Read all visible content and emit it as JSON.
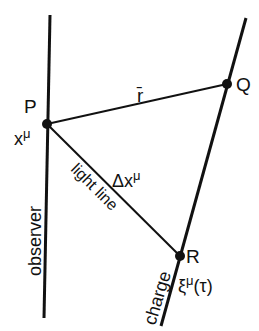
{
  "diagram": {
    "points": {
      "P": {
        "label": "P",
        "coord_label": "x",
        "coord_sup": "μ"
      },
      "Q": {
        "label": "Q"
      },
      "R": {
        "label": "R",
        "coord_label": "ξ",
        "coord_sup": "μ",
        "coord_arg": "(τ)"
      }
    },
    "segments": {
      "PQ": {
        "label": "r̄"
      },
      "PR": {
        "label_delta": "Δx",
        "label_sup": "μ",
        "side_label": "light line"
      }
    },
    "worldlines": {
      "observer": {
        "label": "observer"
      },
      "charge": {
        "label": "charge"
      }
    },
    "colors": {
      "ink": "#111111",
      "background": "#ffffff"
    }
  }
}
